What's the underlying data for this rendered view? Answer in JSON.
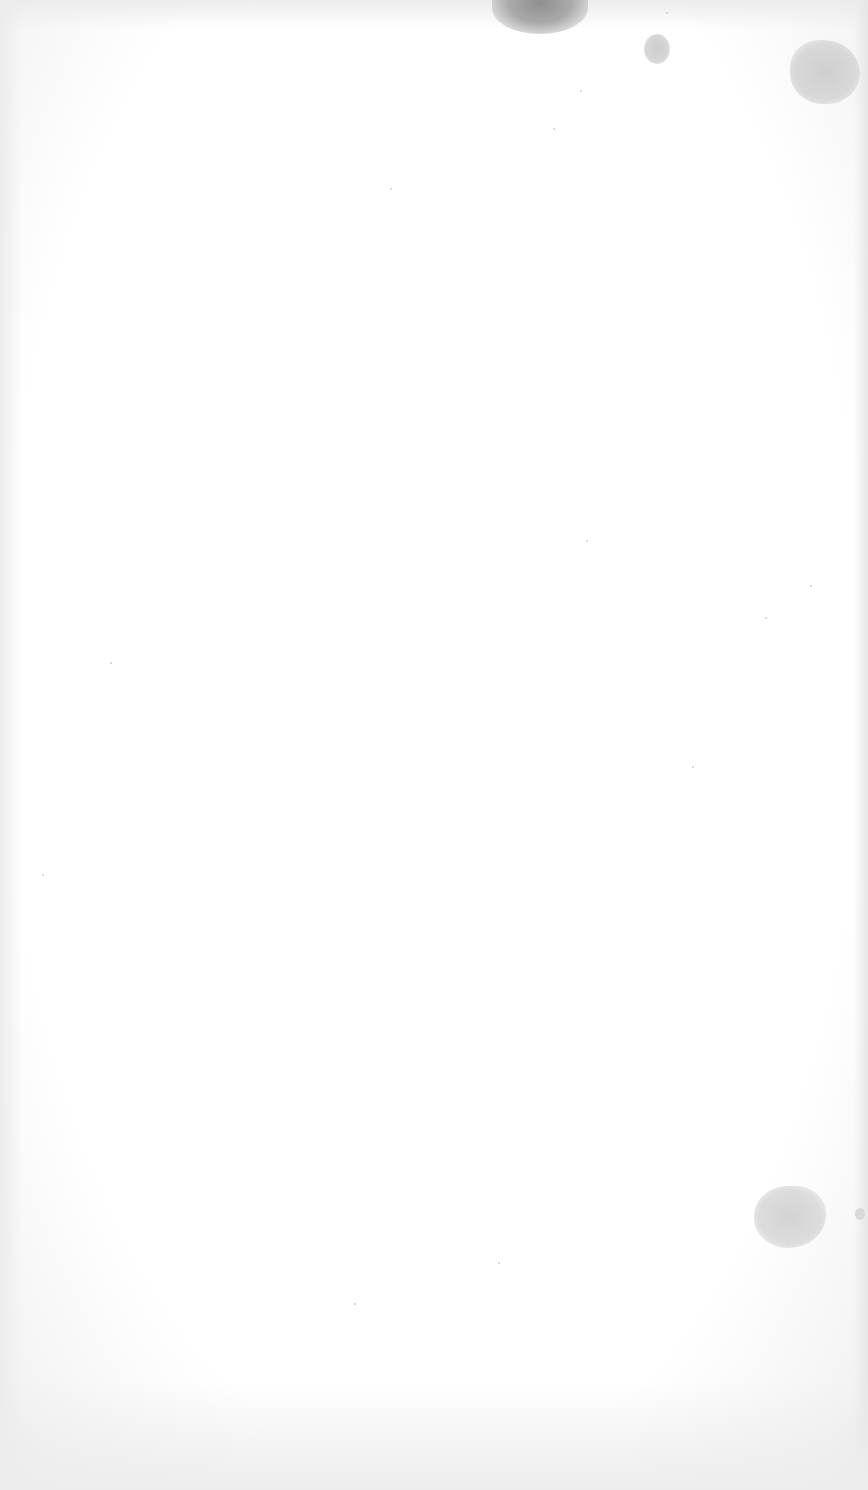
{
  "document": {
    "type": "scanned-page",
    "content": "",
    "description": "Blank scanned paper page with a few gray stains and specks; no visible text"
  },
  "colors": {
    "paper": "#ffffff",
    "edge_shadow": "#ececec",
    "stain_dark": "#8f8f8f",
    "stain_light": "#d3d3d3"
  }
}
